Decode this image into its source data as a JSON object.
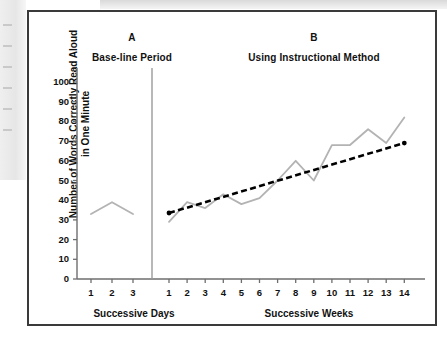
{
  "figure": {
    "panel_a": {
      "letter": "A",
      "title": "Base-line Period",
      "x_axis_title": "Successive Days"
    },
    "panel_b": {
      "letter": "B",
      "title": "Using Instructional Method",
      "x_axis_title": "Successive Weeks"
    },
    "y_axis_label": "Number of Words Correctly Read Aloud in One Minute",
    "colors": {
      "data_line": "#b3b3b3",
      "trend_line": "#000000",
      "axis": "#6e6e6e",
      "frame": "#3a3a3a",
      "phase_divider": "#9a9a9a"
    }
  },
  "chart_data": {
    "type": "line",
    "title": "Number of Words Correctly Read Aloud in One Minute",
    "xlabel": "Successive Days / Successive Weeks",
    "ylabel": "Number of Words Correctly Read Aloud in One Minute",
    "ylim": [
      0,
      100
    ],
    "yticks": [
      0,
      10,
      20,
      30,
      40,
      50,
      60,
      70,
      80,
      90,
      100
    ],
    "grid": false,
    "legend": "none",
    "phases": [
      {
        "name": "A",
        "label": "Base-line Period",
        "x_label": "Successive Days",
        "x": [
          1,
          2,
          3
        ],
        "xticks": [
          "1",
          "2",
          "3"
        ],
        "series": [
          {
            "name": "Words read correctly per minute",
            "values": [
              33,
              39,
              33
            ]
          }
        ]
      },
      {
        "name": "B",
        "label": "Using Instructional Method",
        "x_label": "Successive Weeks",
        "x": [
          1,
          2,
          3,
          4,
          5,
          6,
          7,
          8,
          9,
          10,
          11,
          12,
          13,
          14
        ],
        "xticks": [
          "1",
          "2",
          "3",
          "4",
          "5",
          "6",
          "7",
          "8",
          "9",
          "10",
          "11",
          "12",
          "13",
          "14"
        ],
        "series": [
          {
            "name": "Words read correctly per minute",
            "values": [
              29,
              39,
              36,
              43,
              38,
              41,
              50,
              60,
              50,
              68,
              68,
              76,
              69,
              82
            ]
          },
          {
            "name": "Aim line (trend)",
            "style": "dashed",
            "values": [
              33.5,
              36.3,
              39.0,
              41.8,
              44.5,
              47.3,
              50.0,
              52.8,
              55.5,
              58.3,
              61.0,
              63.8,
              66.5,
              69.0
            ]
          }
        ]
      }
    ]
  }
}
